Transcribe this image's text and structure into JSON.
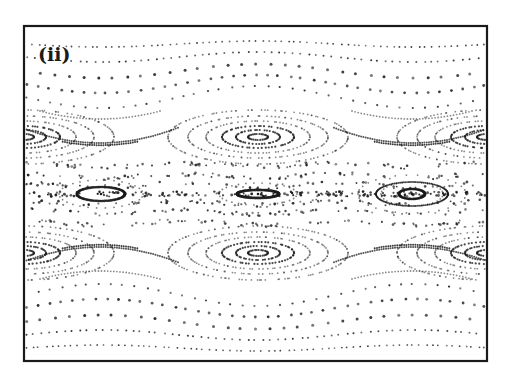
{
  "chart_data": {
    "type": "scatter",
    "title": "",
    "panel_label": "(ii)",
    "xlabel": "",
    "ylabel": "",
    "grid": false,
    "legend": null,
    "frame": {
      "x": 24,
      "y": 26,
      "width": 463,
      "height": 335
    },
    "ink_color": "#1a1a1a",
    "wavy_curves": [
      {
        "y0": 44,
        "amp": -3,
        "dots": 70,
        "size": 0.9
      },
      {
        "y0": 57,
        "amp": -5,
        "dots": 60,
        "size": 1.0
      },
      {
        "y0": 71,
        "amp": -7,
        "dots": 32,
        "size": 1.5
      },
      {
        "y0": 84,
        "amp": -9,
        "dots": 40,
        "size": 1.4
      },
      {
        "y0": 97,
        "amp": -11,
        "dots": 38,
        "size": 1.1
      },
      {
        "y0": 295,
        "amp": 11,
        "dots": 38,
        "size": 1.1
      },
      {
        "y0": 308,
        "amp": 9,
        "dots": 40,
        "size": 1.4
      },
      {
        "y0": 322,
        "amp": 7,
        "dots": 32,
        "size": 1.5
      },
      {
        "y0": 335,
        "amp": 5,
        "dots": 60,
        "size": 1.0
      },
      {
        "y0": 348,
        "amp": 3,
        "dots": 70,
        "size": 0.9
      }
    ],
    "island_rows": [
      {
        "name": "upper",
        "cy": 137,
        "centers": [
          258
        ],
        "edge_centers": [
          24,
          487
        ],
        "rings": [
          [
            10,
            3
          ],
          [
            22,
            7
          ],
          [
            36,
            11
          ],
          [
            52,
            16
          ],
          [
            70,
            21
          ],
          [
            90,
            27
          ]
        ],
        "separatrix_dips": [
          100,
          412
        ]
      },
      {
        "name": "lower",
        "cy": 253,
        "centers": [
          258
        ],
        "edge_centers": [
          24,
          487
        ],
        "rings": [
          [
            10,
            3
          ],
          [
            22,
            7
          ],
          [
            36,
            11
          ],
          [
            52,
            16
          ],
          [
            70,
            21
          ],
          [
            90,
            27
          ]
        ],
        "separatrix_dips": [
          100,
          412
        ]
      }
    ],
    "central_band": {
      "cy": 194,
      "islands": [
        {
          "cx": 101,
          "rx": 24,
          "ry": 7,
          "weight": 2.2
        },
        {
          "cx": 258,
          "rx": 21,
          "ry": 4,
          "weight": 2.4
        },
        {
          "cx": 412,
          "rx": 36,
          "ry": 12,
          "weight": 1.6
        },
        {
          "cx": 412,
          "rx": 13,
          "ry": 5,
          "weight": 2.2
        }
      ],
      "chaotic_lines_y": [
        165,
        176,
        185,
        203,
        212,
        223
      ]
    }
  }
}
